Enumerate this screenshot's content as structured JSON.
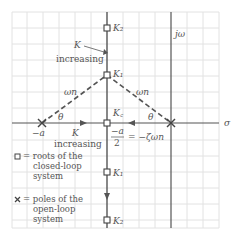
{
  "diagram": {
    "axes": {
      "real_axis_label": "σ",
      "imag_axis_label": "jω"
    },
    "labels": {
      "k2_top": "K₂",
      "k1_top": "K₁",
      "kc": "K꜀",
      "k1_bottom": "K₁",
      "k2_bottom": "K₂",
      "k_increasing_top_k": "K",
      "k_increasing_top_text": "increasing",
      "k_increasing_left_k": "K",
      "k_increasing_left_text": "increasing",
      "omega_n_left": "ωn",
      "omega_n_right": "ωn",
      "theta_left": "θ",
      "theta_right": "θ",
      "neg_a": "−a",
      "neg_a_over_2_num": "−a",
      "neg_a_over_2_den": "2",
      "eq_neg_zeta_omega": "= −ζωn"
    },
    "legend": [
      {
        "symbol": "square",
        "text_lines": [
          "= roots of the",
          "closed-loop",
          "system"
        ]
      },
      {
        "symbol": "cross",
        "text_lines": [
          "= poles of the",
          "open-loop",
          "system"
        ]
      }
    ],
    "colors": {
      "grid": "#e2e2e2",
      "axis": "#555555",
      "locus": "#555555",
      "text": "#555555"
    }
  }
}
